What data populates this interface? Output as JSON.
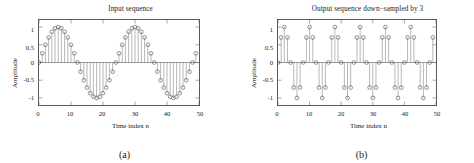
{
  "figure": {
    "panels": [
      {
        "caption": "(a)",
        "title": "Input sequence",
        "xlabel": "Time index n",
        "ylabel": "Amplitude",
        "yticks": [
          "1",
          "0.5",
          "0",
          "-0.5",
          "-1"
        ],
        "xticks": [
          "0",
          "10",
          "20",
          "30",
          "40",
          "50"
        ]
      },
      {
        "caption": "(b)",
        "title": "Output sequence down−sampled by 3",
        "xlabel": "Time index n",
        "ylabel": "Amplitude",
        "yticks": [
          "1",
          "0.5",
          "0",
          "-0.5",
          "-1"
        ],
        "xticks": [
          "0",
          "10",
          "20",
          "30",
          "40",
          "50"
        ]
      }
    ]
  },
  "chart_data": [
    {
      "type": "line",
      "plot_style": "stem",
      "title": "Input sequence",
      "xlabel": "Time index n",
      "ylabel": "Amplitude",
      "xlim": [
        0,
        50
      ],
      "ylim": [
        -1.2,
        1.2
      ],
      "grid": false,
      "legend": null,
      "marker": "circle-open",
      "x": [
        0,
        1,
        2,
        3,
        4,
        5,
        6,
        7,
        8,
        9,
        10,
        11,
        12,
        13,
        14,
        15,
        16,
        17,
        18,
        19,
        20,
        21,
        22,
        23,
        24,
        25,
        26,
        27,
        28,
        29,
        30,
        31,
        32,
        33,
        34,
        35,
        36,
        37,
        38,
        39,
        40,
        41,
        42,
        43,
        44,
        45,
        46,
        47,
        48,
        49
      ],
      "values": [
        0.0,
        0.259,
        0.5,
        0.707,
        0.866,
        0.966,
        1.0,
        0.966,
        0.866,
        0.707,
        0.5,
        0.259,
        0.0,
        -0.259,
        -0.5,
        -0.707,
        -0.866,
        -0.966,
        -1.0,
        -0.966,
        -0.866,
        -0.707,
        -0.5,
        -0.259,
        0.0,
        0.259,
        0.5,
        0.707,
        0.866,
        0.966,
        1.0,
        0.966,
        0.866,
        0.707,
        0.5,
        0.259,
        0.0,
        -0.259,
        -0.5,
        -0.707,
        -0.866,
        -0.966,
        -1.0,
        -0.966,
        -0.866,
        -0.707,
        -0.5,
        -0.259,
        0.0,
        0.259
      ]
    },
    {
      "type": "line",
      "plot_style": "stem",
      "title": "Output sequence down−sampled by 3",
      "xlabel": "Time index n",
      "ylabel": "Amplitude",
      "xlim": [
        0,
        50
      ],
      "ylim": [
        -1.2,
        1.2
      ],
      "grid": false,
      "legend": null,
      "marker": "circle-open",
      "x": [
        0,
        1,
        2,
        3,
        4,
        5,
        6,
        7,
        8,
        9,
        10,
        11,
        12,
        13,
        14,
        15,
        16,
        17,
        18,
        19,
        20,
        21,
        22,
        23,
        24,
        25,
        26,
        27,
        28,
        29,
        30,
        31,
        32,
        33,
        34,
        35,
        36,
        37,
        38,
        39,
        40,
        41,
        42,
        43,
        44,
        45,
        46,
        47,
        48,
        49
      ],
      "values": [
        0.0,
        0.707,
        1.0,
        0.707,
        0.0,
        -0.707,
        -1.0,
        -0.707,
        0.0,
        0.707,
        1.0,
        0.707,
        0.0,
        -0.707,
        -1.0,
        -0.707,
        0.0,
        0.707,
        1.0,
        0.707,
        0.0,
        -0.707,
        -1.0,
        -0.707,
        0.0,
        0.707,
        1.0,
        0.707,
        0.0,
        -0.707,
        -1.0,
        -0.707,
        0.0,
        0.707,
        1.0,
        0.707,
        0.0,
        -0.707,
        -1.0,
        -0.707,
        0.0,
        0.707,
        1.0,
        0.707,
        0.0,
        -0.707,
        -1.0,
        -0.707,
        0.0,
        0.707
      ]
    }
  ]
}
